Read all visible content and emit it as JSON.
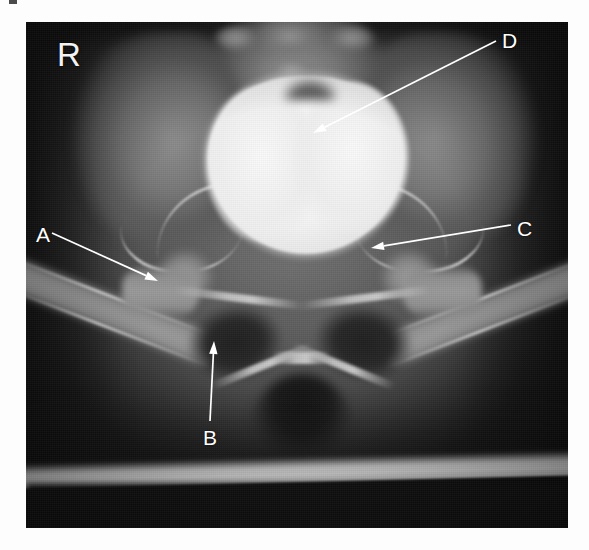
{
  "figure": {
    "modality": "x-ray-radiograph",
    "view": "anteroposterior-pelvis-cystogram",
    "background_color": "#ffffff",
    "film_color": "#151515"
  },
  "side_marker": {
    "text": "R",
    "name": "right-side-marker",
    "color": "#f2f2f2",
    "x": 57,
    "y": 38
  },
  "annotations": [
    {
      "id": "A",
      "label": "A",
      "label_x": 36,
      "label_y": 224,
      "arrow_from_x": 52,
      "arrow_from_y": 233,
      "arrow_to_x": 158,
      "arrow_to_y": 281,
      "color": "#ffffff"
    },
    {
      "id": "B",
      "label": "B",
      "label_x": 203,
      "label_y": 427,
      "arrow_from_x": 210,
      "arrow_from_y": 421,
      "arrow_to_x": 214,
      "arrow_to_y": 341,
      "color": "#ffffff"
    },
    {
      "id": "C",
      "label": "C",
      "label_x": 517,
      "label_y": 218,
      "arrow_from_x": 511,
      "arrow_from_y": 225,
      "arrow_to_x": 371,
      "arrow_to_y": 248,
      "color": "#ffffff"
    },
    {
      "id": "D",
      "label": "D",
      "label_x": 502,
      "label_y": 30,
      "arrow_from_x": 496,
      "arrow_from_y": 41,
      "arrow_to_x": 313,
      "arrow_to_y": 133,
      "color": "#ffffff"
    }
  ]
}
